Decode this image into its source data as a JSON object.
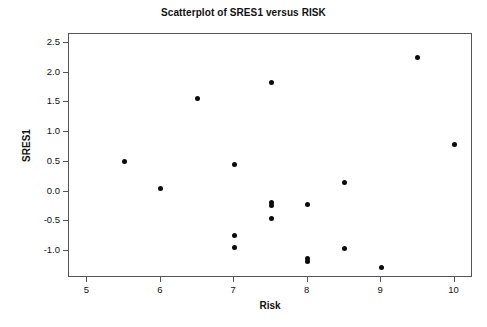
{
  "chart_data": {
    "type": "scatter",
    "title": "Scatterplot of SRES1 versus RISK",
    "xlabel": "Risk",
    "ylabel": "SRES1",
    "xlim": [
      4.75,
      10.25
    ],
    "ylim": [
      -1.45,
      2.65
    ],
    "xticks": [
      5,
      6,
      7,
      8,
      9,
      10
    ],
    "xtick_labels": [
      "5",
      "6",
      "7",
      "8",
      "9",
      "10"
    ],
    "yticks": [
      2.5,
      2.0,
      1.5,
      1.0,
      0.5,
      0.0,
      -0.5,
      -1.0
    ],
    "ytick_labels": [
      "2.5",
      "2.0",
      "1.5",
      "1.0",
      "0.5",
      "0.0",
      "-0.5",
      "-1.0"
    ],
    "grid": false,
    "legend": null,
    "marker": "filled-circle",
    "marker_color": "#0b0b0b",
    "frame_color": "#555555",
    "background": "#ffffff",
    "n_points": 18,
    "x": [
      5.5,
      6.0,
      6.5,
      7.0,
      7.0,
      7.0,
      7.5,
      7.5,
      7.5,
      7.5,
      8.0,
      8.0,
      8.0,
      8.5,
      8.5,
      9.0,
      9.5,
      10.0
    ],
    "y": [
      0.51,
      0.06,
      1.57,
      0.45,
      -0.73,
      -0.94,
      1.84,
      -0.18,
      -0.23,
      -0.45,
      -0.21,
      -1.12,
      -1.17,
      0.15,
      -0.95,
      -1.28,
      2.25,
      0.8
    ],
    "points": [
      {
        "x": 5.5,
        "y": 0.51
      },
      {
        "x": 6.0,
        "y": 0.06
      },
      {
        "x": 6.5,
        "y": 1.57
      },
      {
        "x": 7.0,
        "y": 0.45
      },
      {
        "x": 7.0,
        "y": -0.73
      },
      {
        "x": 7.0,
        "y": -0.94
      },
      {
        "x": 7.5,
        "y": 1.84
      },
      {
        "x": 7.5,
        "y": -0.18
      },
      {
        "x": 7.5,
        "y": -0.23
      },
      {
        "x": 7.5,
        "y": -0.45
      },
      {
        "x": 8.0,
        "y": -0.21
      },
      {
        "x": 8.0,
        "y": -1.12
      },
      {
        "x": 8.0,
        "y": -1.17
      },
      {
        "x": 8.5,
        "y": 0.15
      },
      {
        "x": 8.5,
        "y": -0.95
      },
      {
        "x": 9.0,
        "y": -1.28
      },
      {
        "x": 9.5,
        "y": 2.25
      },
      {
        "x": 10.0,
        "y": 0.8
      }
    ]
  }
}
